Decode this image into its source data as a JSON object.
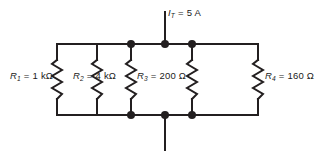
{
  "figure": {
    "name": "parallel-resistor-circuit",
    "type": "schematic",
    "background_color": "#ffffff",
    "line_color": "#231f20",
    "text_color": "#1a1a1a"
  },
  "source": {
    "symbol": "I",
    "subscript": "T",
    "equals": "=",
    "value": "5 A",
    "full_label": "I_T = 5 A"
  },
  "resistors": [
    {
      "id": "R1",
      "symbol": "R",
      "subscript": "1",
      "equals": "=",
      "value": "1 kΩ",
      "full_label": "R1 = 1 kΩ"
    },
    {
      "id": "R2",
      "symbol": "R",
      "subscript": "2",
      "equals": "=",
      "value": "4 kΩ",
      "full_label": "R2 = 4 kΩ"
    },
    {
      "id": "R3",
      "symbol": "R",
      "subscript": "3",
      "equals": "=",
      "value": "200 Ω",
      "full_label": "R3 = 200 Ω"
    },
    {
      "id": "R4",
      "symbol": "R",
      "subscript": "4",
      "equals": "=",
      "value": "160 Ω",
      "full_label": "R4 = 160 Ω"
    }
  ]
}
